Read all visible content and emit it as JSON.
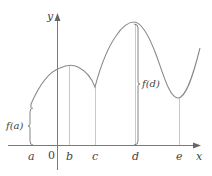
{
  "axes": {
    "x_label": "x",
    "y_label": "y",
    "origin_label": "0"
  },
  "ticks": [
    {
      "label": "a",
      "x": 31
    },
    {
      "label": "b",
      "x": 69
    },
    {
      "label": "c",
      "x": 95
    },
    {
      "label": "d",
      "x": 135
    },
    {
      "label": "e",
      "x": 179
    }
  ],
  "annotations": {
    "fa": "f(a)",
    "fd": "f(d)"
  },
  "colors": {
    "curve": "#8a8a8a",
    "axis": "#7a7a7a",
    "guide": "#c8c8c8",
    "text": "#444444"
  }
}
